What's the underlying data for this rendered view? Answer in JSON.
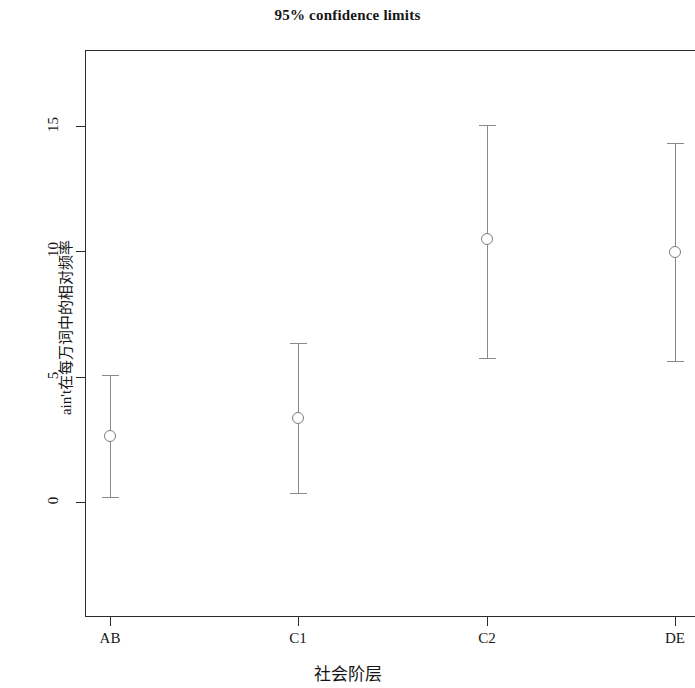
{
  "chart_data": {
    "type": "scatter",
    "title": "95% confidence limits",
    "xlabel": "社会阶层",
    "ylabel": "ain't在每万词中的相对频率",
    "categories": [
      "AB",
      "C1",
      "C2",
      "DE"
    ],
    "values": [
      2.63,
      3.35,
      10.49,
      9.97
    ],
    "error_low": [
      0.2,
      0.36,
      5.74,
      5.62
    ],
    "error_high": [
      5.07,
      6.34,
      15.04,
      14.32
    ],
    "series": [
      {
        "name": "95% confidence limits",
        "points": [
          {
            "category": "AB",
            "value": 2.63,
            "lower": 0.2,
            "upper": 5.07
          },
          {
            "category": "C1",
            "value": 3.35,
            "lower": 0.36,
            "upper": 6.34
          },
          {
            "category": "C2",
            "value": 10.49,
            "lower": 5.74,
            "upper": 15.04
          },
          {
            "category": "DE",
            "value": 9.97,
            "lower": 5.62,
            "upper": 14.32
          }
        ]
      }
    ],
    "yticks": [
      0,
      5,
      10,
      15
    ],
    "ytick_labels": [
      "0",
      "5",
      "10",
      "15"
    ],
    "ylim": [
      -4.1,
      18.5
    ],
    "xlim": [
      0,
      5
    ],
    "grid": false,
    "legend": false,
    "marker": "open-circle",
    "marker_color": "#7d7d7d",
    "line_color": "#8a8a8a",
    "axis_color": "#2b2b2b"
  },
  "axis": {
    "y_label": "ain't在每万词中的相对频率",
    "x_label": "社会阶层",
    "y_tick_0": "0",
    "y_tick_1": "5",
    "y_tick_2": "10",
    "y_tick_3": "15",
    "x_tick_0": "AB",
    "x_tick_1": "C1",
    "x_tick_2": "C2",
    "x_tick_3": "DE"
  },
  "header": {
    "title": "95% confidence limits"
  }
}
